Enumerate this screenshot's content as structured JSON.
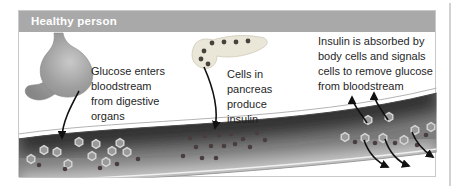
{
  "panel": {
    "title": "Healthy person"
  },
  "annotations": {
    "glucose": "Glucose enters\nbloodstream\nfrom digestive\norgans",
    "pancreas": "Cells in\npancreas\nproduce\ninsulin",
    "insulin": "Insulin is absorbed by\nbody cells and signals\ncells to remove glucose\nfrom bloodstream"
  },
  "icons": {
    "stomach": "stomach-illustration",
    "pancreas": "pancreas-illustration",
    "vessel": "blood-vessel"
  },
  "colors": {
    "header_bg": "#a9a9a9",
    "header_text": "#ffffff",
    "panel_border": "#c9c9c9",
    "divider": "#d2d2d2",
    "vessel_base": "#7d7d7d",
    "vessel_dark": "#303030",
    "vessel_light": "#cccccc",
    "vessel_edge_top": "#4a4a4a",
    "vessel_edge_bottom": "#9c9c9c",
    "wall_outer_line": "#b3b3b3",
    "wall_inner_line": "#f0f0f0",
    "glucose_fill": "#999999",
    "glucose_rim": "#d6d6d6",
    "insulin_dot": "#4a3d3d",
    "stomach_light": "#c9c9c9",
    "stomach_mid": "#9e9e9e",
    "stomach_dark": "#878787",
    "pancreas_fill": "#eae6d8",
    "pancreas_stroke": "#d6d2c2",
    "pancreas_dot": "#46423c",
    "arrow": "#111111"
  },
  "particles": {
    "glucose_left": [
      [
        31,
        159
      ],
      [
        44,
        150
      ],
      [
        57,
        152
      ],
      [
        68,
        164
      ],
      [
        79,
        142
      ],
      [
        92,
        156
      ],
      [
        96,
        144
      ],
      [
        106,
        162
      ],
      [
        112,
        151
      ],
      [
        120,
        143
      ],
      [
        127,
        152
      ]
    ],
    "dots_left": [
      [
        39,
        165
      ],
      [
        65,
        169
      ],
      [
        100,
        168
      ],
      [
        117,
        164
      ],
      [
        138,
        159
      ]
    ],
    "insulin_middle": [
      [
        183,
        156
      ],
      [
        190,
        138
      ],
      [
        196,
        147
      ],
      [
        202,
        158
      ],
      [
        205,
        136
      ],
      [
        211,
        146
      ],
      [
        216,
        158
      ],
      [
        219,
        135
      ],
      [
        224,
        146
      ],
      [
        231,
        134
      ],
      [
        235,
        144
      ],
      [
        243,
        139
      ],
      [
        250,
        147
      ],
      [
        257,
        133
      ],
      [
        265,
        140
      ]
    ],
    "glucose_right": [
      [
        345,
        137
      ],
      [
        365,
        138
      ],
      [
        383,
        138
      ],
      [
        404,
        140
      ],
      [
        415,
        130
      ],
      [
        368,
        120
      ],
      [
        389,
        117
      ],
      [
        431,
        127
      ]
    ],
    "insulin_right": [
      [
        355,
        142
      ],
      [
        375,
        143
      ],
      [
        395,
        143
      ],
      [
        417,
        145
      ],
      [
        426,
        135
      ]
    ]
  },
  "pancreas_cells": [
    [
      212,
      43
    ],
    [
      224,
      42
    ],
    [
      236,
      42
    ],
    [
      248,
      41
    ],
    [
      204,
      51
    ],
    [
      201,
      59
    ],
    [
      208,
      64
    ]
  ]
}
